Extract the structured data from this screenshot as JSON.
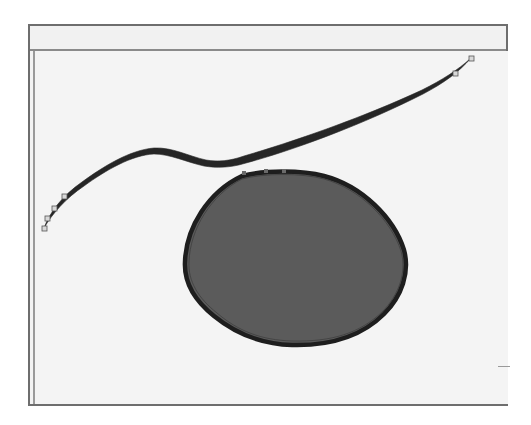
{
  "window": {
    "toolbar_title": "",
    "colors": {
      "frame_border": "#6e6e6e",
      "canvas_background": "#f4f4f4",
      "toolbar_background": "#f1f1f1"
    }
  },
  "canvas": {
    "stroke_path": {
      "label": "variable-width bezier stroke",
      "color": "#2a2a2a",
      "control_points": [
        {
          "x": 42,
          "y": 228
        },
        {
          "x": 45,
          "y": 218
        },
        {
          "x": 52,
          "y": 208
        },
        {
          "x": 62,
          "y": 196
        },
        {
          "x": 453,
          "y": 73
        },
        {
          "x": 469,
          "y": 58
        }
      ]
    },
    "blob_shape": {
      "label": "filled closed shape",
      "fill_color": "#5b5b5b",
      "outline_color": "#1e1e1e"
    }
  }
}
